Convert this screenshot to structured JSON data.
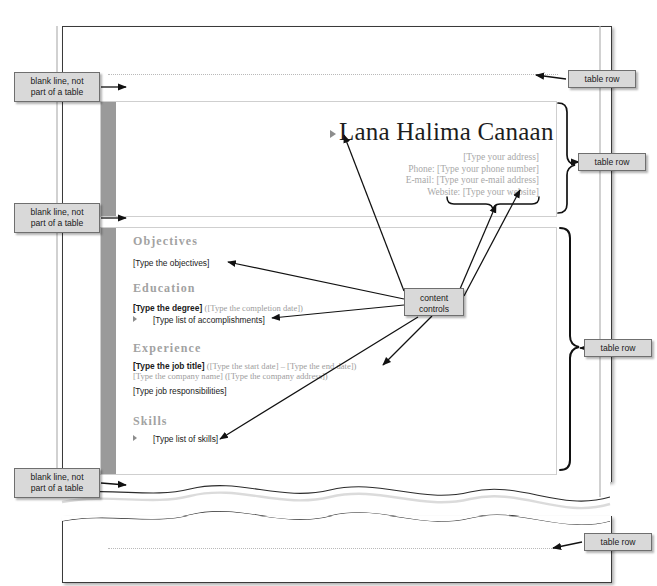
{
  "document": {
    "resume": {
      "name": "Lana Halima Canaan",
      "contact_lines": [
        "[Type your address]",
        "Phone: [Type your phone number]",
        "E-mail: [Type your e-mail address]",
        "Website: [Type your website]"
      ],
      "sections": [
        {
          "heading": "Objectives",
          "lines": [
            {
              "text": "[Type the objectives]"
            }
          ]
        },
        {
          "heading": "Education",
          "lines": [
            {
              "bold": "[Type the degree]",
              "gray": "([Type the completion date])"
            },
            {
              "bullet": "[Type list of accomplishments]"
            }
          ]
        },
        {
          "heading": "Experience",
          "lines": [
            {
              "bold": "[Type the job title]",
              "gray": "([Type the start date] – [Type the end date])"
            },
            {
              "gray_full": "[Type the company name] ([Type the company address])"
            },
            {
              "text": "[Type job responsibilities]"
            }
          ]
        },
        {
          "heading": "Skills",
          "lines": [
            {
              "bullet": "[Type list of skills]"
            }
          ]
        }
      ]
    }
  },
  "annotations": {
    "blank_line": "blank line, not\npart of a table",
    "blank_line_l1": "blank line, not",
    "blank_line_l2": "part of a table",
    "table_row": "table row",
    "content_controls_l1": "content",
    "content_controls_l2": "controls"
  },
  "colors": {
    "sidebar_gray": "#9a9a9a",
    "callout_fill": "#d9d9d9",
    "callout_border": "#6f6f6f",
    "heading_gray": "#a2a2a2",
    "placeholder_gray": "#9d9d9d",
    "page_border": "#3a3a3a",
    "table_border": "#cfcfcf",
    "dotted_row": "#b9b9b9"
  }
}
